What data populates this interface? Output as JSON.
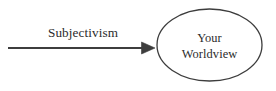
{
  "diagram": {
    "type": "flow-diagram",
    "background_color": "#ffffff",
    "stroke_color": "#3d3d3d",
    "text_color": "#2b2b2b",
    "canvas": {
      "width": 276,
      "height": 91
    },
    "arrow": {
      "label": "Subjectivism",
      "direction": "left-to-right",
      "head_style": "solid-triangle",
      "line": {
        "x1": 8,
        "y1": 48,
        "x2": 142,
        "y2": 48,
        "width": 2
      },
      "head": {
        "tip_x": 155,
        "tip_y": 48,
        "half_height": 6,
        "length": 13
      },
      "label_position": {
        "x": 83,
        "y": 37
      }
    },
    "node": {
      "shape": "ellipse",
      "label_line1": "Your",
      "label_line2": "Worldview",
      "center": {
        "x": 209.5,
        "y": 45
      },
      "radius": {
        "rx": 52.5,
        "ry": 36
      },
      "stroke_width": 1.3,
      "fill": "none",
      "label_line1_position": {
        "x": 209.5,
        "y": 42
      },
      "label_line2_position": {
        "x": 209.5,
        "y": 57
      }
    }
  }
}
